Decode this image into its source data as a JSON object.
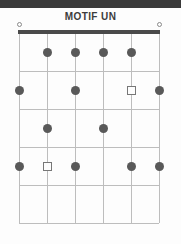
{
  "header": {
    "band_color": "#3a3a3a",
    "title": "MOTIF UN"
  },
  "chart_data": {
    "type": "diagram",
    "title": "MOTIF UN",
    "subtype": "guitar-chord-grid",
    "strings": 6,
    "frets": 5,
    "geometry": {
      "string_x": [
        19,
        47,
        75,
        103,
        131,
        159
      ],
      "fret_y": [
        33,
        71,
        109,
        147,
        185,
        223
      ],
      "nut_left": 18,
      "nut_right": 160,
      "nut_y": 30,
      "nut_thickness": 4
    },
    "colors": {
      "dot": "#595959",
      "square_outline": "#777777",
      "grid": "#bdbdbd",
      "nut": "#4a4a4a",
      "open_circle": "#8a8a8a",
      "background": "#fdfdfd"
    },
    "open_strings": [
      1,
      6
    ],
    "markers": [
      {
        "string": 2,
        "fret": 1,
        "shape": "dot"
      },
      {
        "string": 3,
        "fret": 1,
        "shape": "dot"
      },
      {
        "string": 4,
        "fret": 1,
        "shape": "dot"
      },
      {
        "string": 5,
        "fret": 1,
        "shape": "dot"
      },
      {
        "string": 1,
        "fret": 2,
        "shape": "dot"
      },
      {
        "string": 3,
        "fret": 2,
        "shape": "dot"
      },
      {
        "string": 5,
        "fret": 2,
        "shape": "square"
      },
      {
        "string": 6,
        "fret": 2,
        "shape": "dot"
      },
      {
        "string": 2,
        "fret": 3,
        "shape": "dot"
      },
      {
        "string": 4,
        "fret": 3,
        "shape": "dot"
      },
      {
        "string": 1,
        "fret": 4,
        "shape": "dot"
      },
      {
        "string": 2,
        "fret": 4,
        "shape": "square"
      },
      {
        "string": 3,
        "fret": 4,
        "shape": "dot"
      },
      {
        "string": 5,
        "fret": 4,
        "shape": "dot"
      },
      {
        "string": 6,
        "fret": 4,
        "shape": "dot"
      }
    ]
  }
}
